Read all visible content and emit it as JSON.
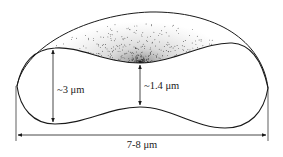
{
  "diagram": {
    "labels": {
      "thickness_rim": "~3 μm",
      "thickness_center": "~1.4 μm",
      "diameter": "7-8 μm"
    },
    "colors": {
      "ink": "#1a1a1a",
      "background": "#ffffff"
    }
  }
}
